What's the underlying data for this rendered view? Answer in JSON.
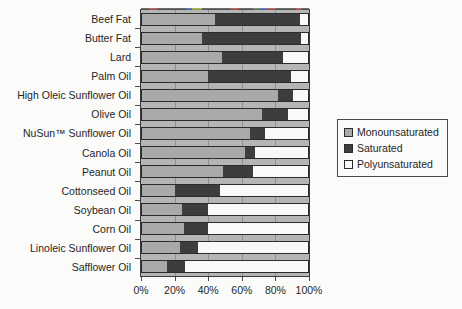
{
  "chart_data": {
    "type": "bar",
    "orientation": "horizontal",
    "stacked": true,
    "title": "",
    "categories": [
      "Beef Fat",
      "Butter Fat",
      "Lard",
      "Palm Oil",
      "High Oleic Sunflower Oil",
      "Olive Oil",
      "NuSun™ Sunflower Oil",
      "Canola Oil",
      "Peanut Oil",
      "Cottonseed Oil",
      "Soybean Oil",
      "Corn Oil",
      "Linoleic Sunflower Oil",
      "Safflower Oil"
    ],
    "series": [
      {
        "name": "Monounsaturated",
        "color": "#a9a9a9",
        "values": [
          44,
          36,
          48,
          40,
          82,
          72,
          65,
          62,
          49,
          20,
          24,
          25,
          23,
          15
        ]
      },
      {
        "name": "Saturated",
        "color": "#3d3d3d",
        "values": [
          51,
          60,
          37,
          50,
          9,
          16,
          9,
          6,
          18,
          27,
          16,
          15,
          11,
          11
        ]
      },
      {
        "name": "Polyunsaturated",
        "color": "#f9f9f7",
        "values": [
          5,
          4,
          15,
          10,
          9,
          12,
          26,
          32,
          33,
          53,
          60,
          60,
          66,
          74
        ]
      }
    ],
    "x_ticks": [
      "0%",
      "20%",
      "40%",
      "60%",
      "80%",
      "100%"
    ],
    "xlim": [
      0,
      100
    ],
    "unit": "%",
    "grid": true,
    "legend_position": "right"
  },
  "colors": {
    "plot_background": "#b5b5b5",
    "gridline": "#8f8f8f",
    "bar_border": "#2c2c2c",
    "page_background": "#fbfbfa",
    "text": "#262626"
  }
}
